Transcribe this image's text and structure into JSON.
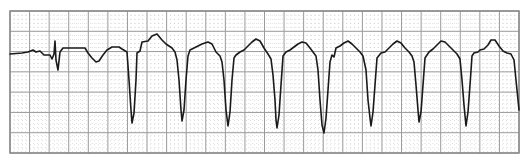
{
  "strip": {
    "description": "ECG rhythm strip on grid paper",
    "grid": {
      "left": 10,
      "top": 11,
      "right": 519,
      "bottom": 153,
      "major_cols": 26,
      "major_rows": 7,
      "minor_per_major": 5,
      "major_color": "#9a9a9a",
      "minor_color": "#c8c8c8",
      "border_color": "#888888"
    },
    "trace": {
      "color": "#1a1a1a",
      "width": 1.6,
      "points": "10,54 22,53 28,52 33,50 36,52 40,51 44,55 50,55 52,59 54,54 55,41 56,60 58,70 60,52 63,48 80,48 85,48 88,53 92,58 96,62 99,61 103,55 107,50 112,47 119,47 122,49 127,52 129,80 131,110 132,123 134,113 136,80 137,53 140,51 142,42 148,41 152,36 157,34 162,40 166,44 172,48 175,52 177,60 179,80 181,110 182,121 184,110 186,80 188,56 190,50 196,47 202,44 208,42 212,44 216,52 220,56 222,62 224,80 226,110 228,126 230,112 232,80 234,58 236,55 240,52 244,50 248,46 252,42 256,39 260,41 264,48 268,54 271,59 273,75 275,100 276,120 277,128 279,115 281,85 283,56 286,52 290,50 294,47 298,44 302,42 306,43 310,48 313,52 316,56 318,70 320,100 322,125 324,133 326,118 328,90 330,62 332,55 334,57 336,48 340,46 344,43 348,41 352,44 356,48 360,52 363,56 366,70 368,100 370,118 371,126 373,112 375,85 377,58 381,53 385,52 389,48 393,44 397,41 401,43 405,48 409,52 412,56 414,62 416,85 418,110 419,122 421,112 423,85 425,58 429,52 433,49 437,45 441,41 445,42 449,46 453,50 457,54 460,59 462,80 464,105 466,126 468,112 470,85 472,56 474,53 478,52 480,50 484,49 488,45 491,40 495,40 499,46 503,51 507,53 511,54 514,60 516,80 518,100 519,110"
    }
  }
}
